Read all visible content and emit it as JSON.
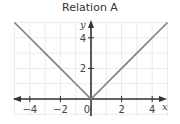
{
  "chart_data": {
    "type": "line",
    "title": "Relation A",
    "xlabel": "x",
    "ylabel": "y",
    "xlim": [
      -5,
      5
    ],
    "ylim": [
      -1,
      5
    ],
    "grid": true,
    "x_ticks": [
      -4,
      -2,
      0,
      2,
      4
    ],
    "y_ticks": [
      2,
      4
    ],
    "series": [
      {
        "name": "Relation A",
        "equation": "y = |x|",
        "x": [
          -5,
          -4,
          -3,
          -2,
          -1,
          0,
          1,
          2,
          3,
          4,
          5
        ],
        "y": [
          5,
          4,
          3,
          2,
          1,
          0,
          1,
          2,
          3,
          4,
          5
        ],
        "color": "#808080"
      }
    ]
  },
  "labels": {
    "title": "Relation A",
    "x_axis": "x",
    "y_axis": "y",
    "x_tick_labels": [
      "−4",
      "−2",
      "0",
      "2",
      "4"
    ],
    "y_tick_labels": [
      "2",
      "4"
    ]
  },
  "colors": {
    "grid": "#e6e6e6",
    "axis": "#333333",
    "line": "#808080"
  }
}
